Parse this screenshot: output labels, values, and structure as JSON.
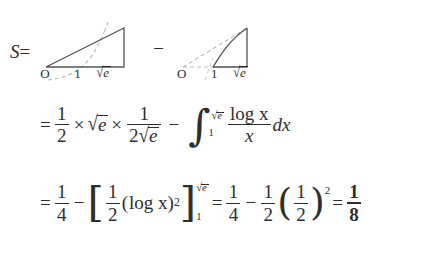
{
  "document": {
    "type": "handwritten-style math derivation",
    "background_color": "#ffffff",
    "ink_color": "#2e2e2e"
  },
  "line1": {
    "lhs": "S",
    "equals": "=",
    "minus": "−",
    "figure_left": {
      "name": "triangle-area-figure",
      "description": "solid right triangle from O to sqrt(e) with dashed log curve crossing it",
      "labels": {
        "origin": "O",
        "one": "1",
        "upper": "e",
        "upper_radical": "√"
      }
    },
    "figure_right": {
      "name": "log-curve-area-figure",
      "description": "solid log curve region from 1 to sqrt(e) with dashed triangle outline",
      "labels": {
        "origin": "O",
        "one": "1",
        "upper": "e",
        "upper_radical": "√"
      }
    }
  },
  "line2": {
    "equals": "=",
    "frac1": {
      "num": "1",
      "den": "2"
    },
    "times1": "×",
    "sqrt_e": {
      "radical": "√",
      "body": "e"
    },
    "times2": "×",
    "frac2": {
      "num": "1",
      "den_coeff": "2",
      "den_radical": "√",
      "den_body": "e"
    },
    "minus": "−",
    "integral": {
      "sign": "∫",
      "lower": "1",
      "upper_radical": "√",
      "upper_body": "e"
    },
    "integrand": {
      "num": "log x",
      "den": "x"
    },
    "differential": "dx"
  },
  "line3": {
    "equals1": "=",
    "frac_quarter": {
      "num": "1",
      "den": "4"
    },
    "minus1": "−",
    "bracket_open": "[",
    "bracket_close": "]",
    "frac_half_inside": {
      "num": "1",
      "den": "2"
    },
    "paren_log_open": "(",
    "log_x": "log x",
    "paren_log_close": ")",
    "log_exponent": "2",
    "bracket_upper_radical": "√",
    "bracket_upper_body": "e",
    "bracket_lower": "1",
    "equals2": "=",
    "frac_quarter2": {
      "num": "1",
      "den": "4"
    },
    "minus2": "−",
    "frac_half2": {
      "num": "1",
      "den": "2"
    },
    "paren_open": "(",
    "frac_half3": {
      "num": "1",
      "den": "2"
    },
    "paren_close": ")",
    "paren_exponent": "2",
    "equals3": "=",
    "result": {
      "num": "1",
      "den": "8"
    }
  }
}
